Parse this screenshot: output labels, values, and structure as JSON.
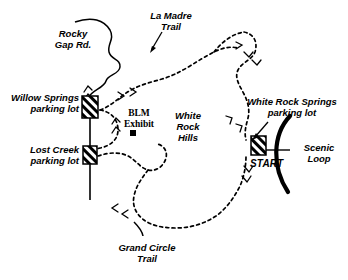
{
  "map": {
    "title": "Red Rock Canyon trail map",
    "background_color": "#ffffff",
    "ink_color": "#000000",
    "labels": {
      "rocky_gap_rd": "Rocky\nGap Rd.",
      "la_madre_trail": "La Madre\nTrail",
      "willow_springs": "Willow Springs\nparking lot",
      "lost_creek": "Lost Creek\nparking lot",
      "blm_exhibit": "BLM\nExhibit",
      "white_rock_hills": "White\nRock\nHills",
      "white_rock_springs": "White Rock Springs\nparking lot",
      "grand_circle_trail": "Grand Circle\nTrail",
      "start": "START",
      "scenic_loop": "Scenic\nLoop"
    },
    "features": {
      "road_style": "solid-wavy-line",
      "trail_style": "dashed-line",
      "parking_symbol": "hatched-rectangle",
      "exhibit_symbol": "filled-square",
      "scenic_loop_symbol": "thick-arc",
      "direction_marker": "chevron"
    }
  }
}
